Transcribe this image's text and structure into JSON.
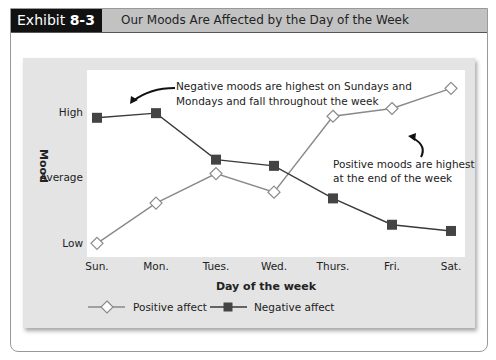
{
  "header": {
    "exhibit_label": "Exhibit",
    "exhibit_number": "8-3",
    "title": "Our Moods Are Affected by the Day of the Week"
  },
  "chart_data": {
    "type": "line",
    "title": "Our Moods Are Affected by the Day of the Week",
    "xlabel": "Day of the week",
    "ylabel": "Mood",
    "categories": [
      "Sun.",
      "Mon.",
      "Tues.",
      "Wed.",
      "Thurs.",
      "Fri.",
      "Sat."
    ],
    "y_tick_labels": [
      "Low",
      "Average",
      "High"
    ],
    "ylim": [
      0,
      10
    ],
    "grid": false,
    "legend_position": "bottom-left",
    "series": [
      {
        "name": "Positive affect",
        "marker": "open-diamond",
        "color": "#8a8a8a",
        "values": [
          0.3,
          2.9,
          4.8,
          3.6,
          8.5,
          9.0,
          10.3
        ]
      },
      {
        "name": "Negative affect",
        "marker": "filled-square",
        "color": "#3a3a3a",
        "values": [
          8.4,
          8.7,
          5.7,
          5.3,
          3.2,
          1.5,
          1.1
        ]
      }
    ],
    "annotations": [
      {
        "text": "Negative moods are highest on Sundays and Mondays and fall throughout the week",
        "lines": [
          "Negative moods are highest on Sundays and",
          "Mondays and fall throughout the week"
        ]
      },
      {
        "text": "Positive moods are highest at the end of the week",
        "lines": [
          "Positive moods are highest",
          "at the end of the week"
        ]
      }
    ]
  },
  "legend": {
    "positive": "Positive affect",
    "negative": "Negative affect"
  }
}
